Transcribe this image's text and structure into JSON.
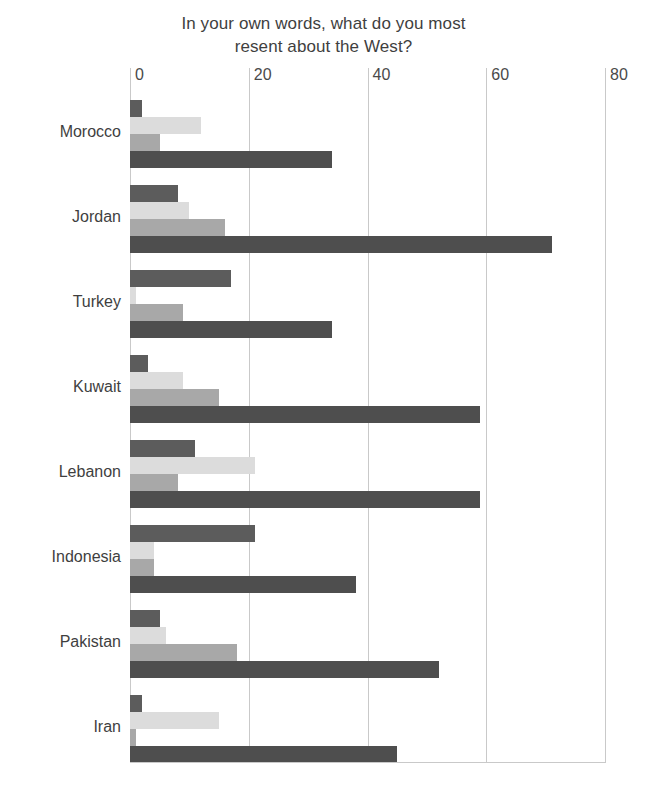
{
  "chart": {
    "title_line1": "In your own words, what do you most",
    "title_line2": "resent about the West?"
  },
  "chart_data": {
    "type": "bar",
    "orientation": "horizontal",
    "title": "In your own words, what do you most resent about the West?",
    "xlabel": "",
    "ylabel": "",
    "xlim": [
      0,
      80
    ],
    "ticks": [
      0,
      20,
      40,
      60,
      80
    ],
    "grid": true,
    "legend": "none",
    "categories": [
      "Morocco",
      "Jordan",
      "Turkey",
      "Kuwait",
      "Lebanon",
      "Indonesia",
      "Pakistan",
      "Iran"
    ],
    "series": [
      {
        "name": "series-1",
        "color": "#5c5c5c",
        "values": [
          2,
          8,
          17,
          3,
          11,
          21,
          5,
          2
        ]
      },
      {
        "name": "series-2",
        "color": "#dcdcdc",
        "values": [
          12,
          10,
          1,
          9,
          21,
          4,
          6,
          15
        ]
      },
      {
        "name": "series-3",
        "color": "#a8a8a8",
        "values": [
          5,
          16,
          9,
          15,
          8,
          4,
          18,
          1
        ]
      },
      {
        "name": "series-4",
        "color": "#4e4e4e",
        "values": [
          34,
          71,
          34,
          59,
          59,
          38,
          52,
          45
        ]
      }
    ]
  },
  "axis": {
    "tick_labels": [
      "0",
      "20",
      "40",
      "60",
      "80"
    ]
  }
}
